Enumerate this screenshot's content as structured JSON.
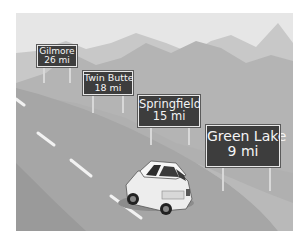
{
  "scene": {
    "description": "Highway illustration with distance signs and a car",
    "colors": {
      "sky": "#e6e6e6",
      "far_mountains": "#c6c6c6",
      "mid_mountains": "#b3b3b3",
      "road": "#a5a5a5",
      "shoulder": "#b8b8b8",
      "sign_bg": "#3d3d3d",
      "sign_text": "#f4f4f4",
      "lane_marks": "#f2f2f2",
      "car_body": "#eeeeee"
    }
  },
  "signs": [
    {
      "name": "Gilmore",
      "distance": "26 mi"
    },
    {
      "name": "Twin Butte",
      "distance": "18 mi"
    },
    {
      "name": "Springfield",
      "distance": "15 mi"
    },
    {
      "name": "Green Lake",
      "distance": "9 mi"
    }
  ]
}
